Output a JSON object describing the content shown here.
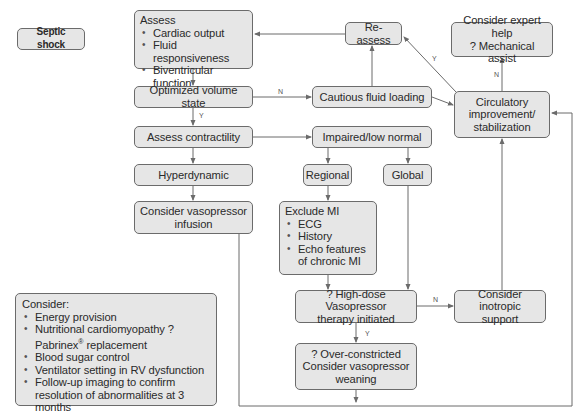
{
  "diagram": {
    "start": {
      "label": "Septic shock"
    },
    "assess": {
      "title": "Assess",
      "items": [
        "Cardiac output",
        "Fluid responsiveness",
        "Biventricular function"
      ]
    },
    "optimized_volume": {
      "label": "Optimized volume state"
    },
    "assess_contractility": {
      "label": "Assess contractility"
    },
    "hyperdynamic": {
      "label": "Hyperdynamic"
    },
    "vasopressor_infusion": {
      "lines": [
        "Consider vasopressor",
        "infusion"
      ]
    },
    "reassess": {
      "label": "Re-assess"
    },
    "cautious_fluid": {
      "label": "Cautious fluid loading"
    },
    "impaired": {
      "label": "Impaired/low normal"
    },
    "regional": {
      "label": "Regional"
    },
    "global": {
      "label": "Global"
    },
    "exclude_mi": {
      "title": "Exclude MI",
      "items": [
        "ECG",
        "History",
        "Echo features of chronic MI"
      ]
    },
    "expert_help": {
      "lines": [
        "Consider expert help",
        "? Mechanical assist"
      ]
    },
    "circulatory": {
      "lines": [
        "Circulatory",
        "improvement/",
        "stabilization"
      ]
    },
    "high_dose": {
      "lines": [
        "? High-dose Vasopressor",
        "therapy initiated"
      ]
    },
    "inotropic": {
      "lines": [
        "Consider inotropic",
        "support"
      ]
    },
    "over_constricted": {
      "lines": [
        "? Over-constricted",
        "Consider vasopressor",
        "weaning"
      ]
    },
    "consider": {
      "title": "Consider:",
      "items": [
        "Energy provision",
        "Nutritional cardiomyopathy ? Pabrinex",
        "Blood sugar control",
        "Ventilator setting in RV dysfunction",
        "Follow-up imaging to confirm resolution of abnormalities at 3 months"
      ],
      "trademark": "®",
      "item2_suffix": "replacement"
    },
    "edge_labels": {
      "optimized_no": "N",
      "optimized_yes": "Y",
      "circulatory_yes": "Y",
      "circulatory_no": "N",
      "high_dose_no": "N",
      "high_dose_yes": "Y"
    }
  },
  "colors": {
    "box_fill": "#e6e6e6",
    "box_border": "#6b6b6b",
    "line": "#6b6b6b",
    "text": "#2a2a2a"
  }
}
